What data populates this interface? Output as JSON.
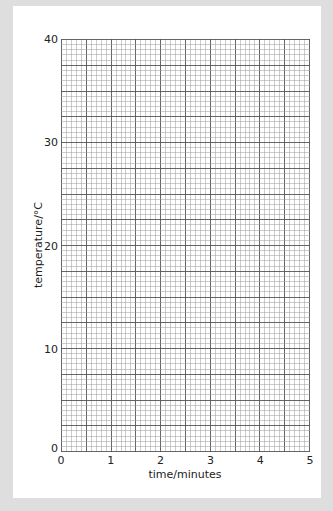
{
  "chart_data": {
    "type": "line",
    "title": "",
    "xlabel": "time/minutes",
    "ylabel": "temperature/°C",
    "xlim": [
      0,
      5
    ],
    "ylim": [
      0,
      40
    ],
    "x_ticks": [
      "0",
      "1",
      "2",
      "3",
      "4",
      "5"
    ],
    "y_ticks": [
      "0",
      "10",
      "20",
      "30",
      "40"
    ],
    "grid": true,
    "grid_minor_x_step": 0.1,
    "grid_major_x_step": 0.5,
    "grid_minor_y_step": 0.5,
    "grid_major_y_step": 2.5,
    "series": [],
    "legend": null
  },
  "colors": {
    "frame": "#dedede",
    "panel": "#ffffff",
    "minor_grid": "#9a9a9a",
    "major_grid": "#555555"
  }
}
